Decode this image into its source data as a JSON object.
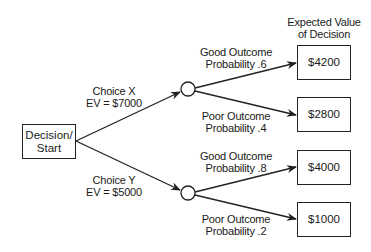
{
  "diagram": {
    "type": "decision-tree",
    "header": {
      "line1": "Expected Value",
      "line2": "of Decision"
    },
    "root": {
      "line1": "Decision/",
      "line2": "Start"
    },
    "choices": [
      {
        "label": "Choice X",
        "ev": "EV = $7000",
        "outcomes": [
          {
            "label": "Good Outcome",
            "probability": "Probability .6",
            "value": "$4200"
          },
          {
            "label": "Poor Outcome",
            "probability": "Probability .4",
            "value": "$2800"
          }
        ]
      },
      {
        "label": "Choice Y",
        "ev": "EV = $5000",
        "outcomes": [
          {
            "label": "Good Outcome",
            "probability": "Probability .8",
            "value": "$4000"
          },
          {
            "label": "Poor Outcome",
            "probability": "Probability .2",
            "value": "$1000"
          }
        ]
      }
    ],
    "colors": {
      "line": "#222222",
      "background": "#ffffff"
    }
  }
}
